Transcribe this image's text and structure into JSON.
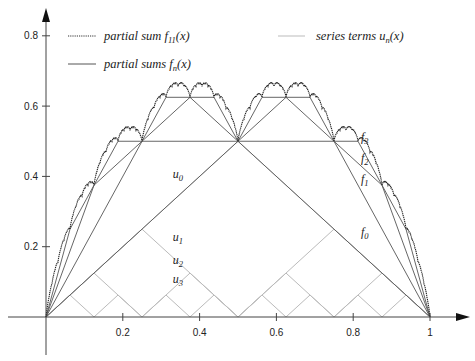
{
  "chart_data": {
    "type": "line",
    "title": "",
    "xlabel": "",
    "ylabel": "",
    "xlim": [
      0,
      1
    ],
    "ylim": [
      0,
      0.8
    ],
    "grid": false,
    "legend_position": "top",
    "x_ticks": [
      {
        "value": 0.2,
        "label": "0.2"
      },
      {
        "value": 0.4,
        "label": "0.4"
      },
      {
        "value": 0.6,
        "label": "0.6"
      },
      {
        "value": 0.8,
        "label": "0.8"
      },
      {
        "value": 1.0,
        "label": "1"
      }
    ],
    "y_ticks": [
      {
        "value": 0.2,
        "label": "0.2"
      },
      {
        "value": 0.4,
        "label": "0.4"
      },
      {
        "value": 0.6,
        "label": "0.6"
      },
      {
        "value": 0.8,
        "label": "0.8"
      }
    ],
    "legend": [
      {
        "label": "partial sum f11(x)",
        "style": "dotted",
        "color": "#333333"
      },
      {
        "label": "partial sums fn(x)",
        "style": "solid",
        "color": "#555555"
      },
      {
        "label": "series terms un(x)",
        "style": "solid",
        "color": "#bbbbbb"
      }
    ],
    "series": [
      {
        "name": "f11",
        "kind": "partial_sum",
        "n": 11,
        "style": "dotted",
        "color": "#222222"
      },
      {
        "name": "f0",
        "kind": "partial_sum",
        "n": 0,
        "color": "#555555"
      },
      {
        "name": "f1",
        "kind": "partial_sum",
        "n": 1,
        "color": "#555555"
      },
      {
        "name": "f2",
        "kind": "partial_sum",
        "n": 2,
        "color": "#555555"
      },
      {
        "name": "f3",
        "kind": "partial_sum",
        "n": 3,
        "color": "#555555"
      },
      {
        "name": "u0",
        "kind": "term",
        "n": 0,
        "color": "#bbbbbb"
      },
      {
        "name": "u1",
        "kind": "term",
        "n": 1,
        "color": "#bbbbbb"
      },
      {
        "name": "u2",
        "kind": "term",
        "n": 2,
        "color": "#bbbbbb"
      },
      {
        "name": "u3",
        "kind": "term",
        "n": 3,
        "color": "#bbbbbb"
      }
    ],
    "formula": "u_n(x) = dist(2^n x, Z) / 2^n ; f_n(x) = sum_{k=0..n} u_k(x)",
    "annotations": [
      {
        "text": "u0",
        "x": 0.33,
        "y": 0.395
      },
      {
        "text": "u1",
        "x": 0.33,
        "y": 0.215
      },
      {
        "text": "u2",
        "x": 0.33,
        "y": 0.152
      },
      {
        "text": "u3",
        "x": 0.33,
        "y": 0.098
      },
      {
        "text": "f0",
        "x": 0.82,
        "y": 0.23
      },
      {
        "text": "f1",
        "x": 0.82,
        "y": 0.38
      },
      {
        "text": "f2",
        "x": 0.82,
        "y": 0.44
      },
      {
        "text": "f3",
        "x": 0.82,
        "y": 0.5
      }
    ]
  },
  "legend_labels": {
    "f11_main": "partial sum f",
    "f11_sub": "11",
    "f11_tail": "(x)",
    "fn_main": "partial sums f",
    "fn_sub": "n",
    "fn_tail": "(x)",
    "un_main": "series terms u",
    "un_sub": "n",
    "un_tail": "(x)"
  }
}
